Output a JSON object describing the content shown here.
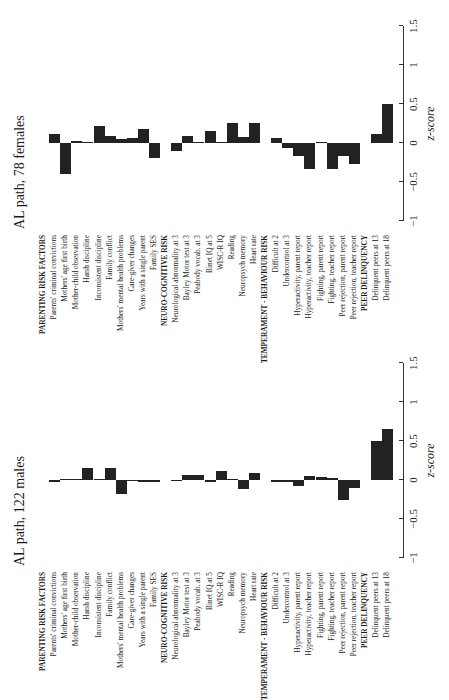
{
  "chart_data": [
    {
      "type": "bar",
      "orientation": "horizontal (figure rotated 90° counter-clockwise)",
      "title": "AL path, 78 females",
      "xlabel": "z-score",
      "xlim": [
        -1,
        1.5
      ],
      "xticks": [
        "-1",
        "-0.5",
        "0",
        "0.5",
        "1",
        "1.5"
      ],
      "groups": [
        {
          "header": "PARENTING RISK FACTORS",
          "categories": [
            "Parents' criminal convictions",
            "Mothers' age first birth",
            "Mother-child observation",
            "Harsh discipline",
            "Inconsistent discipline",
            "Family conflict",
            "Mothers' mental health problems",
            "Care-giver changes",
            "Years with a single parent",
            "Family SES"
          ],
          "values": [
            0.12,
            -0.4,
            0.03,
            0.0,
            0.22,
            0.09,
            0.05,
            0.06,
            0.18,
            -0.19
          ]
        },
        {
          "header": "NEURO-COGNITIVE RISK",
          "categories": [
            "Neurological abnormality at 3",
            "Bayley Motor test at 3",
            "Peabody vocab. at 3",
            "Binet IQ at 5",
            "WISC-R IQ",
            "Reading",
            "Neuropsych memory",
            "Heart rate"
          ],
          "values": [
            -0.1,
            0.09,
            0.01,
            0.15,
            0.01,
            0.25,
            0.08,
            0.25
          ]
        },
        {
          "header": "TEMPERAMENT - BEHAVIOUR RISK",
          "categories": [
            "Difficult at 2",
            "Undercontrol at 3",
            "Hyperactivity, parent report",
            "Hyperactivity, teacher report",
            "Fighting, parent report",
            "Fighting, teacher report",
            "Peer rejection, parent report",
            "Peer rejection, teacher report"
          ],
          "values": [
            0.06,
            -0.07,
            -0.17,
            -0.33,
            0.0,
            -0.33,
            -0.17,
            -0.27
          ]
        },
        {
          "header": "PEER DELINQUENCY",
          "categories": [
            "Delinquent peers at 13",
            "Delinquent peers at 18"
          ],
          "values": [
            0.11,
            0.5
          ]
        }
      ]
    },
    {
      "type": "bar",
      "orientation": "horizontal (figure rotated 90° counter-clockwise)",
      "title": "AL path, 122 males",
      "xlabel": "z-score",
      "xlim": [
        -1,
        1.5
      ],
      "xticks": [
        "-1",
        "-0.5",
        "0",
        "0.5",
        "1",
        "1.5"
      ],
      "groups": [
        {
          "header": "PARENTING RISK FACTORS",
          "categories": [
            "Parents' criminal convictions",
            "Mothers' age first birth",
            "Mother-child observation",
            "Harsh discipline",
            "Inconsistent discipline",
            "Family conflict",
            "Mothers' mental health problems",
            "Care-giver changes",
            "Years with a single parent",
            "Family SES"
          ],
          "values": [
            -0.02,
            0.01,
            0.0,
            0.16,
            0.0,
            0.15,
            -0.18,
            -0.01,
            -0.02,
            -0.02
          ]
        },
        {
          "header": "NEURO-COGNITIVE RISK",
          "categories": [
            "Neurological abnormality at 3",
            "Bayley Motor test at 3",
            "Peabody vocab. at 3",
            "Binet IQ at 5",
            "WISC-R IQ",
            "Reading",
            "Neuropsych memory",
            "Heart rate"
          ],
          "values": [
            -0.01,
            0.07,
            0.06,
            -0.03,
            0.12,
            0.01,
            -0.12,
            0.09
          ]
        },
        {
          "header": "TEMPERAMENT - BEHAVIOUR RISK",
          "categories": [
            "Difficult at 2",
            "Undercontrol at 3",
            "Hyperactivity, parent report",
            "Hyperactivity, teacher report",
            "Fighting, parent report",
            "Fighting, teacher report",
            "Peer rejection, parent report",
            "Peer rejection, teacher report"
          ],
          "values": [
            -0.03,
            -0.03,
            -0.08,
            0.05,
            0.04,
            0.03,
            -0.26,
            -0.1
          ]
        },
        {
          "header": "PEER DELINQUENCY",
          "categories": [
            "Delinquent peers at 13",
            "Delinquent peers at 18"
          ],
          "values": [
            0.5,
            0.65
          ]
        }
      ]
    }
  ],
  "panels": [
    {
      "title": "AL path, 78 females",
      "xlabel": "z-score"
    },
    {
      "title": "AL path, 122 males",
      "xlabel": "z-score"
    }
  ]
}
